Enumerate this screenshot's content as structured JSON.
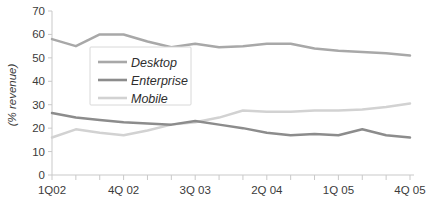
{
  "chart_data": {
    "type": "line",
    "title": "",
    "xlabel": "",
    "ylabel": "(% revenue)",
    "ylim": [
      0,
      70
    ],
    "ytick_step": 10,
    "yticks": [
      "0",
      "10",
      "20",
      "30",
      "40",
      "50",
      "60",
      "70"
    ],
    "grid": false,
    "legend_position": "upper-left-inside",
    "x": [
      "1Q02",
      "2Q02",
      "3Q02",
      "4Q 02",
      "1Q03",
      "2Q03",
      "3Q 03",
      "4Q03",
      "1Q04",
      "2Q 04",
      "3Q04",
      "4Q04",
      "1Q 05",
      "2Q05",
      "3Q05",
      "4Q 05"
    ],
    "xtick_labels_shown": [
      "1Q02",
      "4Q 02",
      "3Q 03",
      "2Q 04",
      "1Q 05",
      "4Q 05"
    ],
    "xtick_label_indices": [
      0,
      3,
      6,
      9,
      12,
      15
    ],
    "series": [
      {
        "name": "Desktop",
        "color": "#a8a8a8",
        "values": [
          58,
          55,
          60,
          60,
          57,
          54.5,
          56,
          54.5,
          55,
          56,
          56,
          54,
          53,
          52.5,
          52,
          51
        ]
      },
      {
        "name": "Enterprise",
        "color": "#8c8c8c",
        "values": [
          26.5,
          24.5,
          23.5,
          22.5,
          22,
          21.5,
          23,
          21.5,
          20,
          18,
          17,
          17.5,
          17,
          19.5,
          17,
          16
        ]
      },
      {
        "name": "Mobile",
        "color": "#d2d2d2",
        "values": [
          16,
          19.5,
          18,
          17,
          19,
          21.5,
          22.5,
          24.5,
          27.5,
          27,
          27,
          27.5,
          27.5,
          28,
          29,
          30.5
        ]
      }
    ]
  },
  "legend": {
    "entries": [
      {
        "label": "Desktop"
      },
      {
        "label": "Enterprise"
      },
      {
        "label": "Mobile"
      }
    ]
  }
}
